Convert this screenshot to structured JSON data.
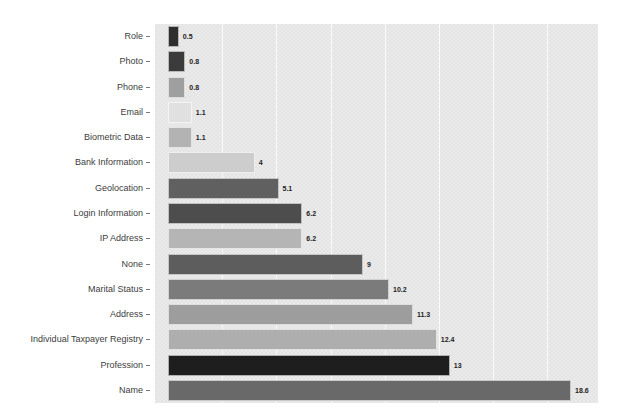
{
  "chart_data": {
    "type": "bar",
    "orientation": "horizontal",
    "title": "",
    "xlabel": "",
    "ylabel": "",
    "legend": "none",
    "categories": [
      "Role",
      "Photo",
      "Phone",
      "Email",
      "Biometric Data",
      "Bank Information",
      "Geolocation",
      "Login Information",
      "IP Address",
      "None",
      "Marital Status",
      "Address",
      "Individual Taxpayer Registry",
      "Profession",
      "Name"
    ],
    "values": [
      0.5,
      0.8,
      0.8,
      1.1,
      1.1,
      4,
      5.1,
      6.2,
      6.2,
      9,
      10.2,
      11.3,
      12.4,
      13,
      18.6
    ],
    "value_labels": [
      "0.5",
      "0.8",
      "0.8",
      "1.1",
      "1.1",
      "4",
      "5.1",
      "6.2",
      "6.2",
      "9",
      "10.2",
      "11.3",
      "12.4",
      "13",
      "18.6"
    ],
    "bar_colors": [
      "#2e2e2e",
      "#3b3b3b",
      "#9f9f9f",
      "#e0e0e0",
      "#b3b3b3",
      "#cdcdcd",
      "#606060",
      "#4d4d4d",
      "#b5b5b5",
      "#5d5d5d",
      "#7b7b7b",
      "#9d9d9d",
      "#aeaeae",
      "#1e1e1e",
      "#696969"
    ],
    "xlim": [
      -0.6,
      19.84
    ],
    "gridline_step": 2.5,
    "grid": "vertical",
    "plot_bg_color": "#e9e9e9",
    "gridline_color": "#ffffff",
    "value_label_color": "#222222",
    "category_label_color": "#3d3d3d"
  }
}
